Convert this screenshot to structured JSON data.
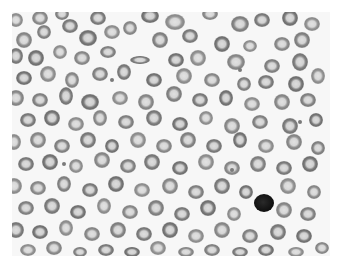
{
  "image": {
    "subject": "blood-smear-micrograph",
    "colors": {
      "background": "#f7f7f7",
      "cell_ring": "#6e6e6e",
      "cell_center": "#d8d8d8",
      "dark_cell": "#151515"
    },
    "cells": [
      [
        16,
        20,
        7,
        7
      ],
      [
        40,
        18,
        8,
        7
      ],
      [
        62,
        14,
        7,
        6
      ],
      [
        98,
        18,
        8,
        7
      ],
      [
        150,
        16,
        9,
        7
      ],
      [
        175,
        22,
        10,
        8
      ],
      [
        210,
        14,
        8,
        6
      ],
      [
        240,
        24,
        9,
        8
      ],
      [
        262,
        20,
        8,
        7
      ],
      [
        290,
        18,
        8,
        8
      ],
      [
        312,
        24,
        8,
        7
      ],
      [
        24,
        40,
        8,
        8
      ],
      [
        44,
        32,
        7,
        7
      ],
      [
        70,
        26,
        8,
        7
      ],
      [
        88,
        38,
        9,
        8
      ],
      [
        112,
        32,
        8,
        7
      ],
      [
        130,
        28,
        7,
        7
      ],
      [
        160,
        40,
        8,
        8
      ],
      [
        190,
        36,
        8,
        7
      ],
      [
        222,
        44,
        8,
        8
      ],
      [
        250,
        46,
        7,
        6
      ],
      [
        282,
        44,
        8,
        7
      ],
      [
        302,
        40,
        8,
        8
      ],
      [
        16,
        56,
        7,
        8
      ],
      [
        36,
        58,
        8,
        8
      ],
      [
        60,
        52,
        7,
        7
      ],
      [
        82,
        58,
        8,
        7
      ],
      [
        108,
        52,
        8,
        6
      ],
      [
        140,
        60,
        10,
        4
      ],
      [
        176,
        60,
        8,
        7
      ],
      [
        198,
        58,
        8,
        8
      ],
      [
        236,
        62,
        9,
        8
      ],
      [
        272,
        66,
        8,
        7
      ],
      [
        300,
        62,
        8,
        9
      ],
      [
        24,
        78,
        8,
        7
      ],
      [
        48,
        74,
        8,
        8
      ],
      [
        72,
        80,
        7,
        8
      ],
      [
        100,
        74,
        8,
        7
      ],
      [
        124,
        72,
        7,
        8
      ],
      [
        154,
        80,
        8,
        7
      ],
      [
        184,
        76,
        8,
        8
      ],
      [
        212,
        80,
        8,
        7
      ],
      [
        244,
        84,
        7,
        7
      ],
      [
        266,
        82,
        8,
        7
      ],
      [
        296,
        84,
        8,
        8
      ],
      [
        318,
        76,
        7,
        8
      ],
      [
        16,
        98,
        8,
        8
      ],
      [
        40,
        100,
        8,
        7
      ],
      [
        66,
        96,
        7,
        9
      ],
      [
        90,
        102,
        9,
        8
      ],
      [
        120,
        98,
        8,
        7
      ],
      [
        146,
        102,
        8,
        8
      ],
      [
        174,
        94,
        8,
        8
      ],
      [
        200,
        100,
        8,
        7
      ],
      [
        226,
        98,
        7,
        8
      ],
      [
        252,
        104,
        8,
        7
      ],
      [
        282,
        102,
        8,
        8
      ],
      [
        308,
        100,
        8,
        7
      ],
      [
        28,
        120,
        8,
        7
      ],
      [
        52,
        118,
        8,
        8
      ],
      [
        76,
        124,
        8,
        7
      ],
      [
        100,
        118,
        7,
        8
      ],
      [
        126,
        122,
        8,
        7
      ],
      [
        154,
        118,
        8,
        8
      ],
      [
        180,
        124,
        8,
        7
      ],
      [
        206,
        118,
        7,
        7
      ],
      [
        232,
        126,
        8,
        8
      ],
      [
        260,
        122,
        8,
        7
      ],
      [
        290,
        126,
        8,
        8
      ],
      [
        316,
        120,
        7,
        7
      ],
      [
        14,
        142,
        7,
        8
      ],
      [
        38,
        140,
        8,
        8
      ],
      [
        62,
        146,
        8,
        7
      ],
      [
        88,
        140,
        8,
        8
      ],
      [
        112,
        146,
        7,
        7
      ],
      [
        138,
        140,
        8,
        8
      ],
      [
        164,
        146,
        8,
        7
      ],
      [
        188,
        140,
        8,
        8
      ],
      [
        214,
        146,
        8,
        7
      ],
      [
        240,
        140,
        7,
        8
      ],
      [
        266,
        146,
        8,
        7
      ],
      [
        294,
        142,
        8,
        8
      ],
      [
        318,
        148,
        7,
        7
      ],
      [
        26,
        164,
        8,
        7
      ],
      [
        50,
        162,
        8,
        8
      ],
      [
        76,
        166,
        7,
        7
      ],
      [
        102,
        160,
        8,
        8
      ],
      [
        128,
        166,
        8,
        7
      ],
      [
        152,
        162,
        8,
        8
      ],
      [
        180,
        168,
        8,
        7
      ],
      [
        206,
        162,
        8,
        8
      ],
      [
        232,
        168,
        8,
        7
      ],
      [
        258,
        164,
        8,
        8
      ],
      [
        284,
        168,
        8,
        7
      ],
      [
        310,
        164,
        8,
        8
      ],
      [
        14,
        186,
        8,
        8
      ],
      [
        38,
        188,
        8,
        7
      ],
      [
        64,
        184,
        7,
        8
      ],
      [
        90,
        190,
        8,
        7
      ],
      [
        116,
        184,
        8,
        8
      ],
      [
        142,
        190,
        8,
        7
      ],
      [
        170,
        186,
        8,
        8
      ],
      [
        196,
        192,
        8,
        7
      ],
      [
        222,
        186,
        8,
        8
      ],
      [
        246,
        192,
        7,
        7
      ],
      [
        288,
        186,
        8,
        8
      ],
      [
        314,
        192,
        7,
        7
      ],
      [
        26,
        208,
        8,
        7
      ],
      [
        52,
        206,
        8,
        8
      ],
      [
        78,
        212,
        8,
        7
      ],
      [
        104,
        206,
        7,
        8
      ],
      [
        130,
        212,
        8,
        7
      ],
      [
        156,
        208,
        8,
        8
      ],
      [
        182,
        214,
        8,
        7
      ],
      [
        208,
        208,
        8,
        8
      ],
      [
        234,
        214,
        7,
        7
      ],
      [
        284,
        210,
        8,
        8
      ],
      [
        308,
        214,
        8,
        7
      ],
      [
        16,
        230,
        8,
        8
      ],
      [
        40,
        232,
        8,
        7
      ],
      [
        66,
        228,
        7,
        8
      ],
      [
        92,
        234,
        8,
        7
      ],
      [
        118,
        230,
        8,
        8
      ],
      [
        144,
        234,
        8,
        7
      ],
      [
        170,
        230,
        8,
        8
      ],
      [
        196,
        236,
        8,
        7
      ],
      [
        222,
        230,
        8,
        8
      ],
      [
        250,
        236,
        8,
        7
      ],
      [
        278,
        232,
        8,
        8
      ],
      [
        304,
        236,
        8,
        7
      ],
      [
        28,
        250,
        8,
        6
      ],
      [
        54,
        248,
        8,
        7
      ],
      [
        80,
        252,
        7,
        5
      ],
      [
        106,
        250,
        8,
        6
      ],
      [
        132,
        252,
        8,
        5
      ],
      [
        158,
        248,
        8,
        7
      ],
      [
        186,
        252,
        8,
        5
      ],
      [
        212,
        250,
        8,
        6
      ],
      [
        240,
        252,
        8,
        5
      ],
      [
        266,
        250,
        8,
        6
      ],
      [
        296,
        252,
        8,
        5
      ],
      [
        322,
        248,
        7,
        6
      ]
    ],
    "dark_cells": [
      [
        264,
        203,
        10,
        9
      ]
    ],
    "small_dots": [
      [
        240,
        70,
        2
      ],
      [
        232,
        170,
        2
      ],
      [
        300,
        122,
        2
      ],
      [
        112,
        80,
        2
      ],
      [
        64,
        164,
        2
      ]
    ]
  }
}
